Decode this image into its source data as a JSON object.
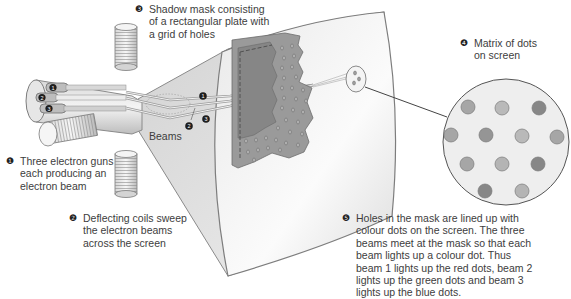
{
  "diagram": {
    "labels": [
      {
        "id": "shadow-mask",
        "number": "❸",
        "text": "Shadow mask consisting\nof a rectangular plate with\na grid of holes"
      },
      {
        "id": "matrix-dots",
        "number": "❹",
        "text": "Matrix of dots\non screen"
      },
      {
        "id": "electron-guns",
        "number": "❶",
        "text": "Three electron guns\neach producing an\nelectron beam"
      },
      {
        "id": "deflecting-coils",
        "number": "❷",
        "text": "Deflecting coils sweep\nthe electron beams\nacross the screen"
      },
      {
        "id": "holes-explanation",
        "number": "❺",
        "text": "Holes in the mask are lined up with\ncolour dots on the screen. The three\nbeams meet at the mask so that each\nbeam lights up a colour dot. Thus\nbeam 1 lights up the red dots, beam 2\nlights up the green dots and beam 3\nlights up the blue dots."
      }
    ],
    "beams_label": "Beams",
    "beam_numbers": [
      "1",
      "2",
      "3"
    ],
    "gun_numbers": [
      "1",
      "2",
      "3"
    ],
    "colors": {
      "tube_fill": "#ececec",
      "tube_stroke": "#8a8a8a",
      "mask_fill": "#8e8e8e",
      "mask_holes_fill": "#a9a9a9",
      "screen_fill": "#f7f7f7",
      "dot_red": "#9a9a9a",
      "dot_green": "#b4b4b4",
      "dot_blue": "#7d7d7d",
      "badge": "#1e1e1e"
    }
  }
}
